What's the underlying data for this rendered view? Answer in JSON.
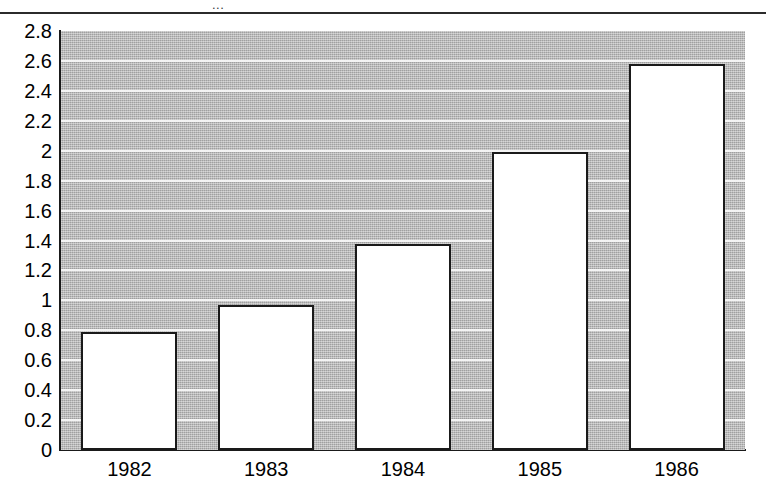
{
  "figure": {
    "background_color": "#ffffff",
    "plot_background_color": "#b3b3b3",
    "gridline_color": "#f4f4f4",
    "axis_color": "#1a1a1a",
    "bar_fill_color": "#ffffff",
    "bar_edge_color": "#1a1a1a",
    "title_fragment": "..."
  },
  "chart_data": {
    "type": "bar",
    "title": "",
    "xlabel": "",
    "ylabel": "",
    "categories": [
      "1982",
      "1983",
      "1984",
      "1985",
      "1986"
    ],
    "values": [
      0.79,
      0.97,
      1.38,
      1.99,
      2.58
    ],
    "ylim": [
      0,
      2.8
    ],
    "ytick_values": [
      0,
      0.2,
      0.4,
      0.6,
      0.8,
      1,
      1.2,
      1.4,
      1.6,
      1.8,
      2,
      2.2,
      2.4,
      2.6,
      2.8
    ],
    "ytick_labels": [
      "0",
      "0.2",
      "0.4",
      "0.6",
      "0.8",
      "1",
      "1.2",
      "1.4",
      "1.6",
      "1.8",
      "2",
      "2.2",
      "2.4",
      "2.6",
      "2.8"
    ],
    "grid": true,
    "grid_axis": "y",
    "legend": false,
    "legend_position": "none",
    "series": [
      {
        "name": "",
        "values": [
          0.79,
          0.97,
          1.38,
          1.99,
          2.58
        ]
      }
    ]
  }
}
